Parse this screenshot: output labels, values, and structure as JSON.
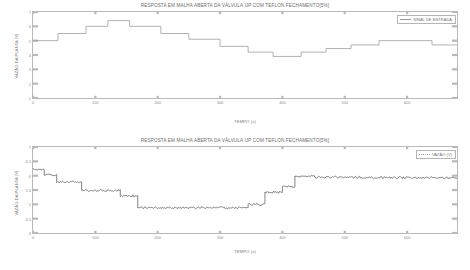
{
  "figures": [
    {
      "id": "input-signal",
      "title": "RESPOSTA EM MALHA ABERTA DA VÁLVULA IJP COM TEFLON FECHAMENTO[5%]",
      "legend": {
        "label": "SINAL DE ENTRADA"
      },
      "chart_data": {
        "type": "line",
        "title": "RESPOSTA EM MALHA ABERTA DA VÁLVULA IJP COM TEFLON FECHAMENTO[5%]",
        "xlabel": "TEMPO (s)",
        "ylabel": "VAZÃO DA PLANTA (V)",
        "xlim": [
          0,
          680
        ],
        "ylim": [
          1,
          7
        ],
        "xticks": [
          0,
          100,
          200,
          300,
          400,
          500,
          600
        ],
        "xticklabels": [
          "0",
          "100",
          "200",
          "300",
          "400",
          "500",
          "600"
        ],
        "yticks": [
          1,
          2,
          3,
          4,
          5,
          6,
          7
        ],
        "yticklabels": [
          "1",
          "2",
          "3",
          "4",
          "5",
          "6",
          "7"
        ],
        "grid": false,
        "legend_position": "upper right",
        "series": [
          {
            "name": "SINAL DE ENTRADA",
            "style": "staircase",
            "x": [
              0,
              40,
              40,
              85,
              85,
              120,
              120,
              155,
              155,
              205,
              205,
              250,
              250,
              300,
              300,
              345,
              345,
              385,
              385,
              430,
              430,
              470,
              470,
              510,
              510,
              555,
              555,
              600,
              600,
              640,
              640,
              680
            ],
            "y": [
              5.0,
              5.0,
              5.5,
              5.5,
              6.0,
              6.0,
              6.4,
              6.4,
              6.0,
              6.0,
              5.5,
              5.5,
              5.1,
              5.1,
              4.6,
              4.6,
              4.2,
              4.2,
              3.9,
              3.9,
              4.2,
              4.2,
              4.45,
              4.45,
              4.7,
              4.7,
              5.0,
              5.0,
              5.0,
              5.0,
              4.7,
              4.7
            ]
          }
        ]
      }
    },
    {
      "id": "plant-output",
      "title": "RESPOSTA EM MALHA ABERTA DA VÁLVULA IJP COM TEFLON FECHAMENTO[5%]",
      "legend": {
        "label": "VAZÃO  (V)"
      },
      "chart_data": {
        "type": "line",
        "title": "RESPOSTA EM MALHA ABERTA DA VÁLVULA IJP COM TEFLON FECHAMENTO[5%]",
        "xlabel": "TEMPO (s)",
        "ylabel": "VAZÃO DA PLANTA (V)",
        "xlim": [
          0,
          680
        ],
        "ylim": [
          4,
          7
        ],
        "xticks": [
          0,
          100,
          200,
          300,
          400,
          500,
          600
        ],
        "xticklabels": [
          "0",
          "100",
          "200",
          "300",
          "400",
          "500",
          "600"
        ],
        "yticks": [
          4,
          4.5,
          5,
          5.5,
          6,
          6.5,
          7
        ],
        "yticklabels": [
          "4",
          "4.5",
          "5",
          "5.5",
          "6",
          "6.5",
          "7"
        ],
        "grid": false,
        "legend_position": "upper right",
        "series": [
          {
            "name": "VAZÃO  (V)",
            "style": "noisy-staircase",
            "noise_amplitude": 0.035,
            "levels_x": [
              0,
              18,
              38,
              78,
              100,
              140,
              168,
              345,
              372,
              400,
              420,
              452,
              470,
              680
            ],
            "levels_y": [
              6.22,
              6.22,
              6.02,
              6.02,
              5.78,
              5.78,
              5.48,
              5.48,
              5.32,
              5.45,
              5.45,
              5.62,
              5.62,
              6.02
            ],
            "x": [
              0,
              18,
              18,
              38,
              38,
              78,
              78,
              140,
              140,
              168,
              168,
              345,
              345,
              372,
              372,
              400,
              400,
              420,
              420,
              452,
              452,
              680
            ],
            "y": [
              6.22,
              6.22,
              6.02,
              6.02,
              5.78,
              5.78,
              5.48,
              5.48,
              5.3,
              5.3,
              4.88,
              4.88,
              5.0,
              5.0,
              5.42,
              5.42,
              5.62,
              5.62,
              5.98,
              5.98,
              5.95,
              5.92
            ]
          }
        ]
      }
    }
  ]
}
